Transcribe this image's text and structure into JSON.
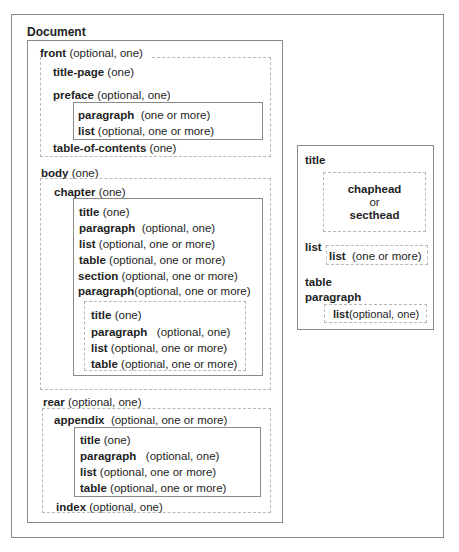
{
  "document": {
    "title": "Document",
    "front": {
      "label": "front",
      "card": "(optional, one)",
      "items": [
        {
          "label": "title-page",
          "card": "(one)"
        },
        {
          "label": "preface",
          "card": "(optional, one)"
        },
        {
          "label": "table-of-contents",
          "card": "(one)"
        }
      ],
      "preface_children": [
        {
          "label": "paragraph",
          "card": "(one or more)"
        },
        {
          "label": "list",
          "card": "(optional, one or more)"
        }
      ]
    },
    "body": {
      "label": "body",
      "card": "(one)",
      "chapter": {
        "label": "chapter",
        "card": "(one)",
        "children": [
          {
            "label": "title",
            "card": "(one)"
          },
          {
            "label": "paragraph",
            "card": "(optional, one)"
          },
          {
            "label": "list",
            "card": "(optional, one or more)"
          },
          {
            "label": "table",
            "card": "(optional, one or more)"
          },
          {
            "label": "section",
            "card": "(optional, one or more)"
          },
          {
            "label": "paragraph",
            "card": "(optional, one or more)"
          }
        ],
        "section_children": [
          {
            "label": "title",
            "card": "(one)"
          },
          {
            "label": "paragraph",
            "card": "(optional, one)"
          },
          {
            "label": "list",
            "card": "(optional, one or more)"
          },
          {
            "label": "table",
            "card": "(optional, one or more)"
          }
        ]
      }
    },
    "rear": {
      "label": "rear",
      "card": "(optional, one)",
      "appendix": {
        "label": "appendix",
        "card": "(optional, one or more)",
        "children": [
          {
            "label": "title",
            "card": "(one)"
          },
          {
            "label": "paragraph",
            "card": "(optional, one)"
          },
          {
            "label": "list",
            "card": "(optional, one or more)"
          },
          {
            "label": "table",
            "card": "(optional, one or more)"
          }
        ]
      },
      "index": {
        "label": "index",
        "card": "(optional, one)"
      }
    }
  },
  "legend": {
    "title": "title",
    "title_options": [
      "chaphead",
      "or",
      "secthead"
    ],
    "list": "list",
    "list_child": {
      "label": "list",
      "card": "(one or more)"
    },
    "table": "table",
    "paragraph": "paragraph",
    "paragraph_child": {
      "label": "list",
      "card": "(optional, one)"
    }
  }
}
